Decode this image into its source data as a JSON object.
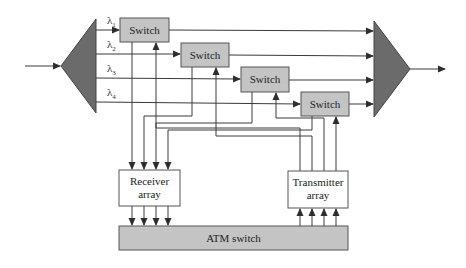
{
  "diagram": {
    "type": "block-diagram",
    "colors": {
      "line": "#3a3a3a",
      "triangle_fill": "#6b6b6b",
      "switch_fill": "#c4c4c4",
      "atm_fill": "#c4c4c4",
      "box_fill": "#ffffff"
    },
    "demultiplexer": {
      "shape": "triangle-left"
    },
    "multiplexer": {
      "shape": "triangle-right"
    },
    "wavelengths": [
      {
        "symbol": "λ",
        "sub": "1"
      },
      {
        "symbol": "λ",
        "sub": "2"
      },
      {
        "symbol": "λ",
        "sub": "3"
      },
      {
        "symbol": "λ",
        "sub": "4"
      }
    ],
    "switches": [
      {
        "label": "Switch"
      },
      {
        "label": "Switch"
      },
      {
        "label": "Switch"
      },
      {
        "label": "Switch"
      }
    ],
    "receiver": {
      "line1": "Receiver",
      "line2": "array"
    },
    "transmitter": {
      "line1": "Transmitter",
      "line2": "array"
    },
    "atm": {
      "label": "ATM switch"
    }
  }
}
